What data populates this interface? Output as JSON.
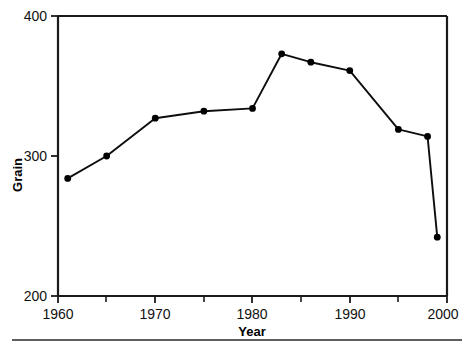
{
  "chart_data": {
    "type": "line",
    "title": "",
    "subtitle": "",
    "xlabel": "Year",
    "ylabel": "Grain",
    "xlim": [
      1960,
      2000
    ],
    "ylim": [
      200,
      400
    ],
    "grid": false,
    "legend": false,
    "legend_position": "none",
    "x_major_ticks": [
      1960,
      1970,
      1980,
      1990,
      2000
    ],
    "x_minor_ticks": [
      1965,
      1975,
      1985,
      1995
    ],
    "x_tick_labels": [
      "1960",
      "1970",
      "1980",
      "1990",
      "2000"
    ],
    "y_major_ticks": [
      200,
      300,
      400
    ],
    "y_tick_labels": [
      "200",
      "300",
      "400"
    ],
    "marker": "filled-circle",
    "series": [
      {
        "name": "Grain",
        "color": "#000000",
        "x": [
          1961,
          1965,
          1970,
          1975,
          1980,
          1983,
          1986,
          1990,
          1995,
          1998,
          1999
        ],
        "values": [
          284,
          300,
          327,
          332,
          334,
          373,
          367,
          361,
          319,
          314,
          242
        ]
      }
    ],
    "points": [
      {
        "year": 1961,
        "grain": 284
      },
      {
        "year": 1965,
        "grain": 300
      },
      {
        "year": 1970,
        "grain": 327
      },
      {
        "year": 1975,
        "grain": 332
      },
      {
        "year": 1980,
        "grain": 334
      },
      {
        "year": 1983,
        "grain": 373
      },
      {
        "year": 1986,
        "grain": 367
      },
      {
        "year": 1990,
        "grain": 361
      },
      {
        "year": 1995,
        "grain": 319
      },
      {
        "year": 1998,
        "grain": 314
      },
      {
        "year": 1999,
        "grain": 242
      }
    ]
  },
  "axes": {
    "y_label": "Grain",
    "x_label": "Year",
    "y_top_label": "400",
    "y_mid_label": "300",
    "y_bottom_label": "200",
    "x_labels": [
      "1960",
      "1970",
      "1980",
      "1990",
      "2000"
    ]
  },
  "colors": {
    "line": "#0d0d0d",
    "marker": "#000000",
    "axis": "#1a1a1a",
    "background": "#ffffff",
    "text": "#111111",
    "footer_rule": "#2a2a2a"
  }
}
